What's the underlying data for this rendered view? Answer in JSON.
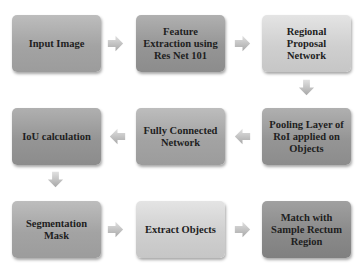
{
  "diagram": {
    "nodes": [
      {
        "id": "n1",
        "label": "Input Image"
      },
      {
        "id": "n2",
        "label": "Feature Extraction using Res Net 101"
      },
      {
        "id": "n3",
        "label": "Regional Proposal Network"
      },
      {
        "id": "n4",
        "label": "Pooling Layer of RoI applied on Objects"
      },
      {
        "id": "n5",
        "label": "Fully Connected Network"
      },
      {
        "id": "n6",
        "label": "IoU calculation"
      },
      {
        "id": "n7",
        "label": "Segmentation Mask"
      },
      {
        "id": "n8",
        "label": "Extract Objects"
      },
      {
        "id": "n9",
        "label": "Match with Sample Rectum Region"
      }
    ],
    "edges": [
      {
        "from": "n1",
        "to": "n2",
        "direction": "right"
      },
      {
        "from": "n2",
        "to": "n3",
        "direction": "right"
      },
      {
        "from": "n3",
        "to": "n4",
        "direction": "down"
      },
      {
        "from": "n4",
        "to": "n5",
        "direction": "left"
      },
      {
        "from": "n5",
        "to": "n6",
        "direction": "left"
      },
      {
        "from": "n6",
        "to": "n7",
        "direction": "down"
      },
      {
        "from": "n7",
        "to": "n8",
        "direction": "right"
      },
      {
        "from": "n8",
        "to": "n9",
        "direction": "right"
      }
    ],
    "colors": {
      "dark_box": "#959595",
      "mid_box": "#a3a3a3",
      "light_box": "#cfcfcf",
      "darker_box": "#8a8a8a",
      "arrow": "#c4c4c4",
      "text": "#1e1e1e"
    }
  }
}
